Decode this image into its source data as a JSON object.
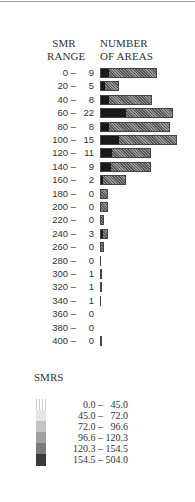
{
  "chart_data": {
    "type": "bar",
    "orientation": "horizontal",
    "title": "",
    "xlabel": "NUMBER OF AREAS",
    "ylabel": "SMR RANGE",
    "categories": [
      "0 –",
      "20 –",
      "40 –",
      "60 –",
      "80 –",
      "100 –",
      "120 –",
      "140 –",
      "160 –",
      "180 –",
      "200 –",
      "220 –",
      "240 –",
      "260 –",
      "280 –",
      "300 –",
      "320 –",
      "340 –",
      "360 –",
      "380 –",
      "400 –"
    ],
    "values": [
      9,
      5,
      8,
      22,
      8,
      15,
      11,
      9,
      2,
      0,
      0,
      0,
      3,
      0,
      0,
      1,
      1,
      1,
      0,
      0,
      0
    ],
    "bar_pixel_widths": [
      57,
      19,
      52,
      73,
      70,
      77,
      51,
      51,
      26,
      8,
      8,
      4,
      8,
      4,
      1,
      2,
      2,
      1,
      0,
      0,
      2
    ],
    "dark_fraction": [
      0.15,
      0.25,
      0.15,
      0.35,
      0.12,
      0.24,
      0.22,
      0.2,
      0.1,
      0,
      0,
      0,
      0.4,
      0,
      0,
      1,
      1,
      1,
      0,
      0,
      0
    ],
    "legend": {
      "title": "SMRS",
      "entries": [
        "0.0 –   45.0",
        "45.0 –   72.0",
        "72.0 –   96.6",
        "96.6 – 120.3",
        "120.3 – 154.5",
        "154.5 – 504.0"
      ],
      "colors": [
        "#f2f2f2",
        "#e6e6e6",
        "#c4c4c4",
        "#a0a0a0",
        "#7a7a7a",
        "#3a3a3a"
      ]
    }
  },
  "header": {
    "range_line1": "SMR",
    "range_line2": "RANGE",
    "num_line1": "NUMBER",
    "num_line2": "OF AREAS"
  }
}
